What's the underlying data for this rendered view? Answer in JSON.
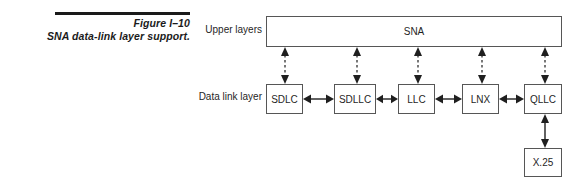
{
  "figure": {
    "number": "Figure I–10",
    "title": "SNA data-link layer support."
  },
  "diagram": {
    "rows": [
      {
        "label": "Upper layers"
      },
      {
        "label": "Data link layer"
      }
    ],
    "upper_layer_boxes": [
      {
        "label": "SNA"
      }
    ],
    "data_link_boxes": [
      {
        "label": "SDLC"
      },
      {
        "label": "SDLLC"
      },
      {
        "label": "LLC"
      },
      {
        "label": "LNX"
      },
      {
        "label": "QLLC"
      }
    ],
    "lower_boxes": [
      {
        "label": "X.25"
      }
    ],
    "connectors": {
      "horizontal": [
        {
          "from": "SDLC",
          "to": "SDLLC",
          "style": "double-arrow-solid"
        },
        {
          "from": "SDLLC",
          "to": "LLC",
          "style": "double-arrow-solid"
        },
        {
          "from": "LLC",
          "to": "LNX",
          "style": "double-arrow-solid"
        },
        {
          "from": "LNX",
          "to": "QLLC",
          "style": "double-arrow-solid"
        }
      ],
      "vertical_dashed": [
        {
          "from": "SNA",
          "to": "SDLC",
          "style": "double-arrow-dashed"
        },
        {
          "from": "SNA",
          "to": "SDLLC",
          "style": "double-arrow-dashed"
        },
        {
          "from": "SNA",
          "to": "LLC",
          "style": "double-arrow-dashed"
        },
        {
          "from": "SNA",
          "to": "LNX",
          "style": "double-arrow-dashed"
        },
        {
          "from": "SNA",
          "to": "QLLC",
          "style": "double-arrow-dashed"
        }
      ],
      "vertical_solid": [
        {
          "from": "QLLC",
          "to": "X.25",
          "style": "double-arrow-solid"
        }
      ]
    }
  },
  "colors": {
    "rule": "#1a1a1a",
    "box_border": "#565656",
    "text": "#1f1f1f",
    "background": "#ffffff"
  }
}
